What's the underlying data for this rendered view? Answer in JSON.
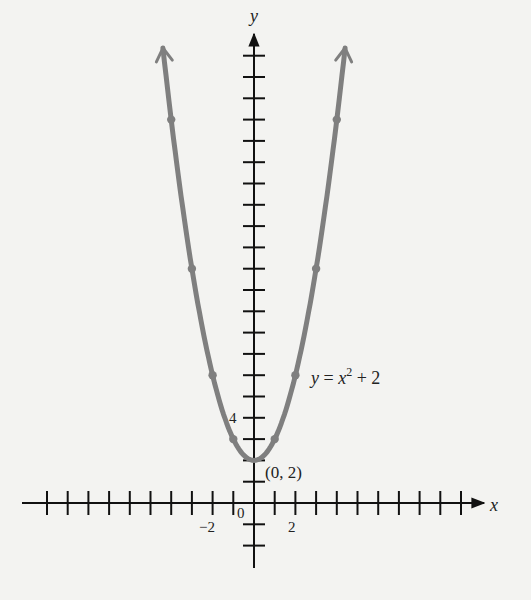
{
  "chart_data": {
    "type": "line",
    "title": "",
    "function": "y = x^2 + 2",
    "xlabel": "x",
    "ylabel": "y",
    "xlim": [
      -10.5,
      11
    ],
    "ylim": [
      -3,
      22
    ],
    "x_ticks": [
      -10,
      -9,
      -8,
      -7,
      -6,
      -5,
      -4,
      -3,
      -2,
      -1,
      1,
      2,
      3,
      4,
      5,
      6,
      7,
      8,
      9,
      10
    ],
    "x_tick_labels": [
      {
        "value": -2,
        "label": "−2"
      },
      {
        "value": 0,
        "label": "0"
      },
      {
        "value": 2,
        "label": "2"
      }
    ],
    "y_ticks": [
      -2,
      -1,
      1,
      2,
      3,
      4,
      5,
      6,
      7,
      8,
      9,
      10,
      11,
      12,
      13,
      14,
      15,
      16,
      17,
      18,
      19,
      20,
      21
    ],
    "y_tick_labels": [
      {
        "value": 4,
        "label": "4"
      }
    ],
    "grid": false,
    "series": [
      {
        "name": "y = x^2 + 2",
        "color": "#7f7f7f",
        "x": [
          -4,
          -3,
          -2,
          -1,
          0,
          1,
          2,
          3,
          4
        ],
        "values": [
          18,
          11,
          6,
          3,
          2,
          3,
          6,
          11,
          18
        ],
        "curve_x_range": [
          -4.4,
          4.4
        ],
        "marked_points": true
      }
    ],
    "annotations": [
      {
        "text": "(0, 2)",
        "x": 0,
        "y": 2
      },
      {
        "text": "y = x² + 2",
        "x": 2.8,
        "y": 5.5
      }
    ]
  },
  "labels": {
    "x_axis": "x",
    "y_axis": "y",
    "vertex": "(0, 2)",
    "equation_y": "y",
    "equation_eq": " = ",
    "equation_x": "x",
    "equation_exp": "2",
    "equation_rest": " + 2",
    "tick_neg2": "−2",
    "tick_0": "0",
    "tick_2": "2",
    "tick_4": "4"
  },
  "colors": {
    "background": "#f3f3f1",
    "axis": "#111111",
    "curve": "#7f7f7f"
  }
}
